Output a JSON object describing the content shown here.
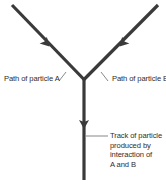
{
  "diagram": {
    "colors": {
      "track": "#3a3a3a",
      "leader": "#555555",
      "text": "#2e2e2e",
      "background": "#ffffff"
    },
    "labels": {
      "particle_a": "Path of particle A",
      "particle_b": "Path of particle B",
      "product_track": [
        "Track of particle",
        "produced by",
        "interaction of",
        "A and B"
      ]
    },
    "tracks": [
      {
        "name": "particle-a-path",
        "from": [
          12,
          5
        ],
        "to": [
          84,
          80
        ],
        "arrow_direction": "toward junction"
      },
      {
        "name": "particle-b-path",
        "from": [
          158,
          5
        ],
        "to": [
          84,
          80
        ],
        "arrow_direction": "toward junction"
      },
      {
        "name": "product-track",
        "from": [
          84,
          80
        ],
        "to": [
          84,
          180
        ],
        "arrow_direction": "down"
      }
    ]
  }
}
